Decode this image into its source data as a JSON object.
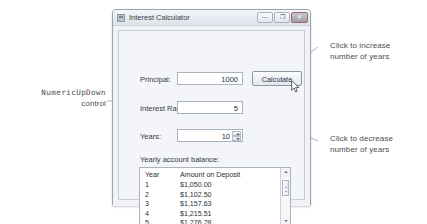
{
  "window": {
    "title": "Interest Calculator",
    "icon": "app-icon",
    "controls": {
      "minimize": "—",
      "maximize": "❐",
      "close": "✕"
    }
  },
  "form": {
    "principal": {
      "label": "Principal:",
      "value": "1000"
    },
    "interest_rate": {
      "label": "Interest Rate",
      "value": "5"
    },
    "years": {
      "label": "Years:",
      "value": "10"
    },
    "calculate_button": "Calculate",
    "balance_label": "Yearly account balance:"
  },
  "results": {
    "columns": [
      "Year",
      "Amount on Deposit"
    ],
    "rows": [
      {
        "year": "1",
        "amount": "$1,050.00"
      },
      {
        "year": "2",
        "amount": "$1,102.50"
      },
      {
        "year": "3",
        "amount": "$1,157.63"
      },
      {
        "year": "4",
        "amount": "$1,215.51"
      },
      {
        "year": "5",
        "amount": "$1,276.28"
      }
    ]
  },
  "annotations": {
    "left": {
      "line1": "NumericUpDown",
      "line2": "control"
    },
    "increase": {
      "line1": "Click to increase",
      "line2": "number of years"
    },
    "decrease": {
      "line1": "Click to decrease",
      "line2": "number of years"
    }
  },
  "colors": {
    "annotation_text": "#4d4d4d",
    "leader_line": "#8f8f8f",
    "window_border": "#9aa4b0",
    "field_border": "#a9b2bd"
  }
}
